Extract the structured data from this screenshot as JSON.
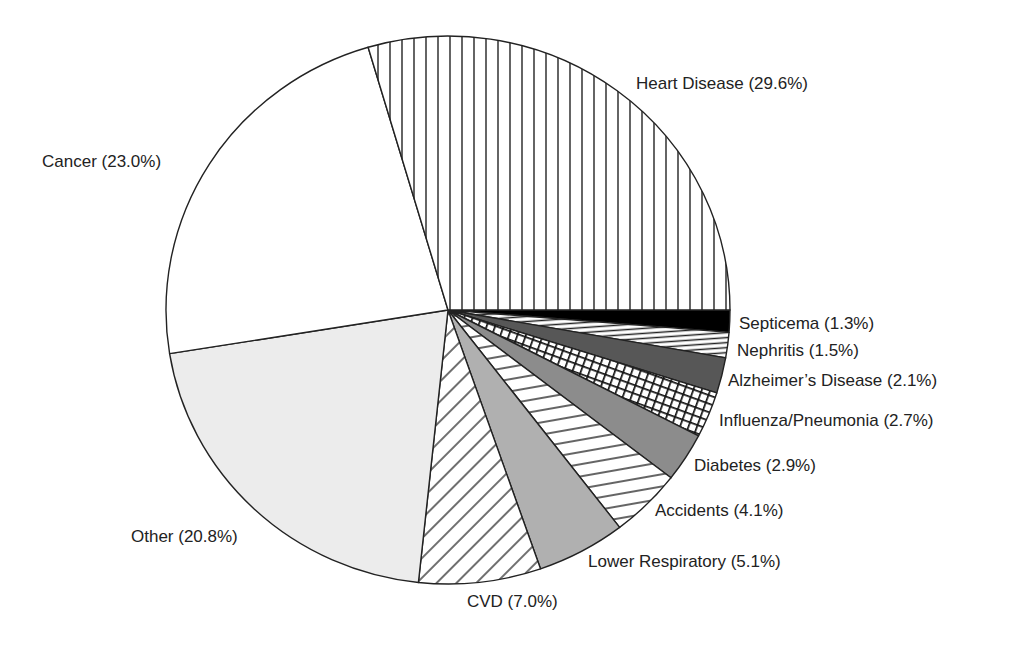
{
  "chart_data": {
    "type": "pie",
    "title": "",
    "start_angle_deg": 0,
    "direction": "clockwise_from_3_oclock",
    "slices": [
      {
        "name": "Septicema",
        "value": 1.3,
        "label": "Septicema (1.3%)",
        "fill": "solid-black",
        "color": "#000000"
      },
      {
        "name": "Nephritis",
        "value": 1.5,
        "label": "Nephritis (1.5%)",
        "fill": "horizontal-lines",
        "color": "#ffffff"
      },
      {
        "name": "Alzheimer's Disease",
        "value": 2.1,
        "label": "Alzheimer's Disease (2.1%)",
        "fill": "solid-dark-gray",
        "color": "#575757"
      },
      {
        "name": "Influenza/Pneumonia",
        "value": 2.7,
        "label": "Influenza/Pneumonia (2.7%)",
        "fill": "crosshatch",
        "color": "#ffffff"
      },
      {
        "name": "Diabetes",
        "value": 2.9,
        "label": "Diabetes (2.9%)",
        "fill": "solid-medium-gray",
        "color": "#8c8c8c"
      },
      {
        "name": "Accidents",
        "value": 4.1,
        "label": "Accidents (4.1%)",
        "fill": "horizontal-lines",
        "color": "#ffffff"
      },
      {
        "name": "Lower Respiratory",
        "value": 5.1,
        "label": "Lower Respiratory (5.1%)",
        "fill": "solid-light-gray",
        "color": "#b0b0b0"
      },
      {
        "name": "CVD",
        "value": 7.0,
        "label": "CVD (7.0%)",
        "fill": "diagonal-lines",
        "color": "#ffffff"
      },
      {
        "name": "Other",
        "value": 20.8,
        "label": "Other (20.8%)",
        "fill": "solid-very-light-gray",
        "color": "#ececec"
      },
      {
        "name": "Cancer",
        "value": 23.0,
        "label": "Cancer (23.0%)",
        "fill": "solid-white",
        "color": "#ffffff"
      },
      {
        "name": "Heart Disease",
        "value": 29.6,
        "label": "Heart Disease (29.6%)",
        "fill": "vertical-lines",
        "color": "#ffffff"
      }
    ],
    "categories": [
      "Septicema",
      "Nephritis",
      "Alzheimer's Disease",
      "Influenza/Pneumonia",
      "Diabetes",
      "Accidents",
      "Lower Respiratory",
      "CVD",
      "Other",
      "Cancer",
      "Heart Disease"
    ],
    "values": [
      1.3,
      1.5,
      2.1,
      2.7,
      2.9,
      4.1,
      5.1,
      7.0,
      20.8,
      23.0,
      29.6
    ],
    "legend": "none (direct labels)"
  },
  "labels": {
    "heart": "Heart Disease (29.6%)",
    "cancer": "Cancer (23.0%)",
    "septicema": "Septicema (1.3%)",
    "nephritis": "Nephritis (1.5%)",
    "alzheimers": "Alzheimer’s Disease (2.1%)",
    "influenza": "Influenza/Pneumonia (2.7%)",
    "diabetes": "Diabetes (2.9%)",
    "accidents": "Accidents (4.1%)",
    "lower_resp": "Lower Respiratory (5.1%)",
    "cvd": "CVD (7.0%)",
    "other": "Other (20.8%)"
  }
}
